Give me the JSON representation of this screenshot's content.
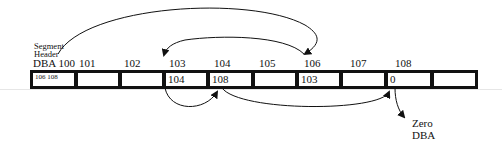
{
  "diagram": {
    "segment_header_label": [
      "Segment",
      "Header"
    ],
    "dba_prefix": "DBA",
    "blocks": [
      {
        "dba": "100",
        "content": "106 108"
      },
      {
        "dba": "101",
        "content": ""
      },
      {
        "dba": "102",
        "content": ""
      },
      {
        "dba": "103",
        "content": "104"
      },
      {
        "dba": "104",
        "content": "108"
      },
      {
        "dba": "105",
        "content": ""
      },
      {
        "dba": "106",
        "content": "103"
      },
      {
        "dba": "107",
        "content": ""
      },
      {
        "dba": "108",
        "content": "0"
      },
      {
        "dba": "",
        "content": ""
      }
    ],
    "zero_label": [
      "Zero",
      "DBA"
    ],
    "arrows": [
      {
        "from": "100",
        "to": "106"
      },
      {
        "from": "106",
        "to": "103"
      },
      {
        "from": "103",
        "to": "104"
      },
      {
        "from": "104",
        "to": "108"
      },
      {
        "from": "108",
        "to": "Zero DBA"
      }
    ],
    "colors": {
      "line": "#111111",
      "background": "#ffffff"
    }
  }
}
